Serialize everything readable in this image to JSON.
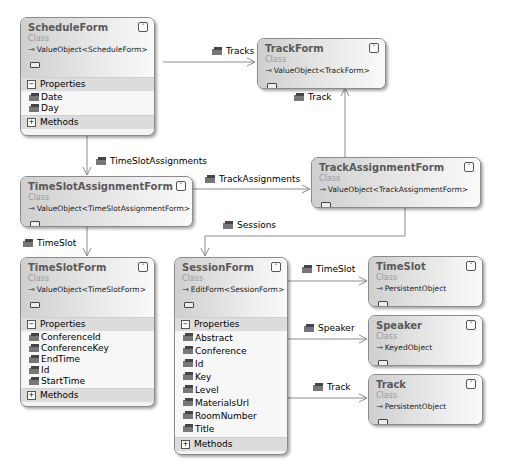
{
  "classes": {
    "ScheduleForm": {
      "name": "ScheduleForm",
      "stereotype": "Class",
      "base": "ValueObject<ScheduleForm>",
      "toggle": "collapse",
      "sections": {
        "properties": "Properties",
        "methods": "Methods"
      },
      "properties": [
        "Date",
        "Day"
      ]
    },
    "TrackForm": {
      "name": "TrackForm",
      "stereotype": "Class",
      "base": "ValueObject<TrackForm>",
      "toggle": "expand"
    },
    "TimeSlotAssignmentForm": {
      "name": "TimeSlotAssignmentForm",
      "stereotype": "Class",
      "base": "ValueObject<TimeSlotAssignmentForm>",
      "toggle": "expand"
    },
    "TrackAssignmentForm": {
      "name": "TrackAssignmentForm",
      "stereotype": "Class",
      "base": "ValueObject<TrackAssignmentForm>",
      "toggle": "expand"
    },
    "TimeSlotForm": {
      "name": "TimeSlotForm",
      "stereotype": "Class",
      "base": "ValueObject<TimeSlotForm>",
      "toggle": "collapse",
      "sections": {
        "properties": "Properties",
        "methods": "Methods"
      },
      "properties": [
        "ConferenceId",
        "ConferenceKey",
        "EndTime",
        "Id",
        "StartTime"
      ]
    },
    "SessionForm": {
      "name": "SessionForm",
      "stereotype": "Class",
      "base": "EditForm<SessionForm>",
      "toggle": "collapse",
      "sections": {
        "properties": "Properties",
        "methods": "Methods"
      },
      "properties": [
        "Abstract",
        "Conference",
        "Id",
        "Key",
        "Level",
        "MaterialsUrl",
        "RoomNumber",
        "Title"
      ]
    },
    "TimeSlot": {
      "name": "TimeSlot",
      "stereotype": "Class",
      "base": "PersistentObject",
      "toggle": "expand"
    },
    "Speaker": {
      "name": "Speaker",
      "stereotype": "Class",
      "base": "KeyedObject",
      "toggle": "expand"
    },
    "Track": {
      "name": "Track",
      "stereotype": "Class",
      "base": "PersistentObject",
      "toggle": "expand"
    }
  },
  "associations": [
    {
      "label": "Tracks",
      "from": "ScheduleForm",
      "to": "TrackForm"
    },
    {
      "label": "Track",
      "from": "TrackAssignmentForm",
      "to": "TrackForm"
    },
    {
      "label": "TimeSlotAssignments",
      "from": "ScheduleForm",
      "to": "TimeSlotAssignmentForm"
    },
    {
      "label": "TrackAssignments",
      "from": "TimeSlotAssignmentForm",
      "to": "TrackAssignmentForm"
    },
    {
      "label": "TimeSlot",
      "from": "TimeSlotAssignmentForm",
      "to": "TimeSlotForm"
    },
    {
      "label": "Sessions",
      "from": "TrackAssignmentForm",
      "to": "SessionForm"
    },
    {
      "label": "TimeSlot",
      "from": "SessionForm",
      "to": "TimeSlot"
    },
    {
      "label": "Speaker",
      "from": "SessionForm",
      "to": "Speaker"
    },
    {
      "label": "Track",
      "from": "SessionForm",
      "to": "Track"
    }
  ],
  "glyphs": {
    "collapse": "≈",
    "expand": "≈",
    "minus": "−",
    "plus": "+",
    "inherit": "⊸"
  }
}
